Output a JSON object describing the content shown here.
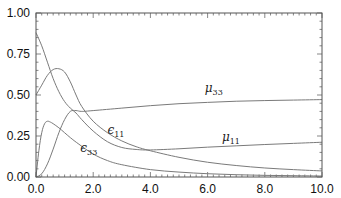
{
  "chart_data": {
    "type": "line",
    "title": "",
    "xlabel": "",
    "ylabel": "",
    "xlim": [
      0.0,
      10.0
    ],
    "ylim": [
      0.0,
      1.0
    ],
    "x_ticks": [
      "0.0",
      "2.0",
      "4.0",
      "6.0",
      "8.0",
      "10.0"
    ],
    "y_ticks": [
      "0.00",
      "0.25",
      "0.50",
      "0.75",
      "1.00"
    ],
    "x_minor_step": 0.2,
    "y_minor_step": 0.05,
    "grid": false,
    "legend": "none (inline curve labels)",
    "series": [
      {
        "name": "μ33",
        "label_main": "μ",
        "label_sub": "33",
        "label_pos": [
          5.9,
          0.52
        ],
        "x": [
          0,
          0.2,
          0.4,
          0.6,
          0.8,
          1.0,
          1.2,
          1.4,
          1.6,
          2.0,
          3.0,
          4.0,
          5.0,
          6.0,
          7.0,
          8.0,
          9.0,
          10.0
        ],
        "y": [
          0.0,
          0.02,
          0.08,
          0.17,
          0.27,
          0.35,
          0.4,
          0.405,
          0.4,
          0.405,
          0.42,
          0.435,
          0.447,
          0.455,
          0.462,
          0.466,
          0.469,
          0.472
        ]
      },
      {
        "name": "μ11",
        "label_main": "μ",
        "label_sub": "11",
        "label_pos": [
          6.5,
          0.22
        ],
        "x": [
          0,
          0.2,
          0.4,
          0.6,
          0.8,
          1.0,
          1.2,
          1.4,
          1.6,
          2.0,
          2.5,
          3.0,
          3.5,
          4.0,
          5.0,
          6.0,
          7.0,
          8.0,
          9.0,
          10.0
        ],
        "y": [
          0.88,
          0.8,
          0.7,
          0.6,
          0.52,
          0.46,
          0.42,
          0.39,
          0.35,
          0.28,
          0.215,
          0.18,
          0.168,
          0.165,
          0.172,
          0.182,
          0.19,
          0.198,
          0.205,
          0.212
        ]
      },
      {
        "name": "ε11",
        "label_main": "ϵ",
        "label_sub": "11",
        "label_pos": [
          2.5,
          0.265
        ],
        "x": [
          0,
          0.2,
          0.4,
          0.6,
          0.8,
          1.0,
          1.2,
          1.4,
          1.6,
          2.0,
          2.5,
          3.0,
          3.5,
          4.0,
          5.0,
          6.0,
          7.0,
          8.0,
          9.0,
          10.0
        ],
        "y": [
          0.5,
          0.56,
          0.62,
          0.655,
          0.66,
          0.64,
          0.58,
          0.5,
          0.43,
          0.34,
          0.27,
          0.22,
          0.185,
          0.16,
          0.12,
          0.09,
          0.07,
          0.055,
          0.045,
          0.037
        ]
      },
      {
        "name": "ε33",
        "label_main": "ϵ",
        "label_sub": "33",
        "label_pos": [
          1.55,
          0.15
        ],
        "x": [
          0,
          0.1,
          0.2,
          0.3,
          0.4,
          0.5,
          0.6,
          0.8,
          1.0,
          1.2,
          1.5,
          2.0,
          2.5,
          3.0,
          4.0,
          5.0,
          6.0,
          7.0,
          8.0,
          9.0,
          10.0
        ],
        "y": [
          0.0,
          0.16,
          0.27,
          0.325,
          0.34,
          0.335,
          0.325,
          0.3,
          0.27,
          0.24,
          0.2,
          0.14,
          0.1,
          0.075,
          0.045,
          0.03,
          0.02,
          0.014,
          0.01,
          0.008,
          0.006
        ]
      }
    ],
    "line_color": "#7a7a7a",
    "axis_color": "#555555"
  }
}
